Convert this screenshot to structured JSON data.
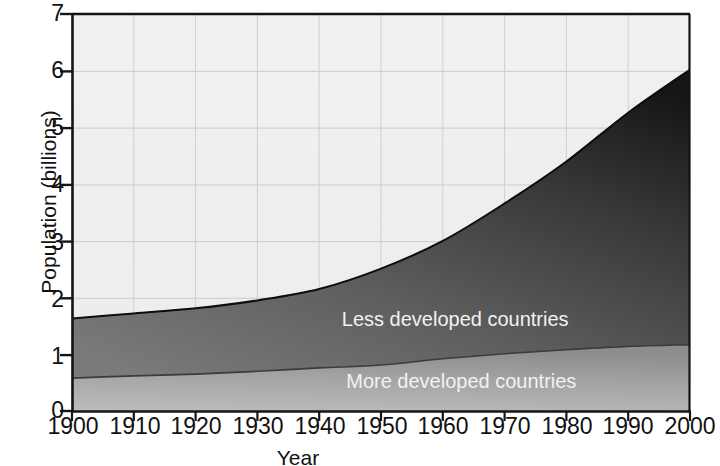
{
  "chart_data": {
    "type": "area",
    "title": "",
    "xlabel": "Year",
    "ylabel": "Population (billions)",
    "xlim": [
      1900,
      2000
    ],
    "ylim": [
      0,
      7
    ],
    "xticks": [
      1900,
      1910,
      1920,
      1930,
      1940,
      1950,
      1960,
      1970,
      1980,
      1990,
      2000
    ],
    "yticks": [
      0,
      1,
      2,
      3,
      4,
      5,
      6,
      7
    ],
    "grid": true,
    "stacked": true,
    "legend_position": "inline-labels",
    "x": [
      1900,
      1910,
      1920,
      1930,
      1940,
      1950,
      1960,
      1970,
      1980,
      1990,
      2000
    ],
    "series": [
      {
        "name": "More developed countries",
        "color": "#9a9a9a",
        "values": [
          0.58,
          0.62,
          0.65,
          0.7,
          0.76,
          0.81,
          0.92,
          1.01,
          1.08,
          1.14,
          1.17
        ]
      },
      {
        "name": "Less developed countries",
        "color": "#4a4a4a",
        "values": [
          1.05,
          1.1,
          1.16,
          1.25,
          1.39,
          1.7,
          2.08,
          2.65,
          3.32,
          4.12,
          4.85
        ]
      }
    ],
    "totals": [
      1.63,
      1.72,
      1.81,
      1.95,
      2.15,
      2.51,
      3.0,
      3.66,
      4.4,
      5.26,
      6.02
    ],
    "annotations": [
      {
        "text": "Less developed countries",
        "x": 1962,
        "y": 1.6
      },
      {
        "text": "More developed countries",
        "x": 1963,
        "y": 0.52
      }
    ]
  },
  "axes": {
    "y_tick_labels": [
      "7",
      "6",
      "5",
      "4",
      "3",
      "2",
      "1",
      "0"
    ],
    "x_tick_labels": [
      "1900",
      "1910",
      "1920",
      "1930",
      "1940",
      "1950",
      "1960",
      "1970",
      "1980",
      "1990",
      "2000"
    ],
    "y_title": "Population (billions)",
    "x_title": "Year"
  },
  "colors": {
    "plot_background": "#efefef",
    "gridline": "#cfcfcf",
    "axis": "#1a1a1a",
    "less_developed_top": "#1b1b1b",
    "less_developed_bottom": "#6e6e6e",
    "more_developed_top": "#828282",
    "more_developed_bottom": "#b4b4b4",
    "label_text": "#f2f2f2"
  }
}
